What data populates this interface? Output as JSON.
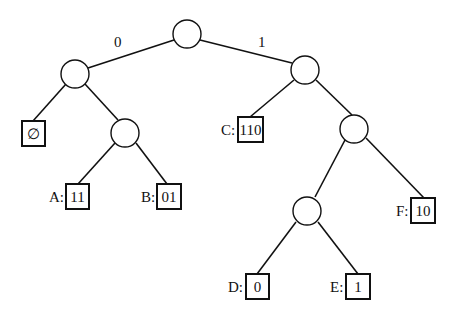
{
  "diagram": {
    "type": "binary-tree",
    "edge_labels": {
      "left": "0",
      "right": "1"
    },
    "leaves": {
      "empty": {
        "label": "",
        "code": "∅"
      },
      "A": {
        "label": "A:",
        "code": "11"
      },
      "B": {
        "label": "B:",
        "code": "01"
      },
      "C": {
        "label": "C:",
        "code": "110"
      },
      "D": {
        "label": "D:",
        "code": "0"
      },
      "E": {
        "label": "E:",
        "code": "1"
      },
      "F": {
        "label": "F:",
        "code": "10"
      }
    }
  }
}
